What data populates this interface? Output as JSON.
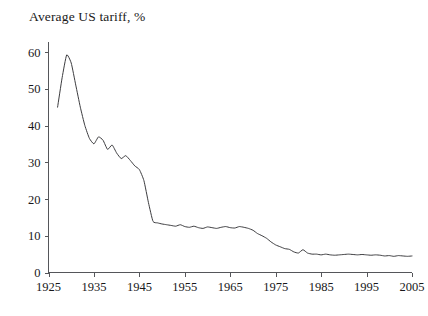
{
  "chart_data": {
    "type": "line",
    "title": "Average US tariff, %",
    "xlabel": "",
    "ylabel": "",
    "xlim": [
      1925,
      2005
    ],
    "ylim": [
      0,
      62
    ],
    "grid": false,
    "legend": null,
    "xticks": [
      "1925",
      "1935",
      "1945",
      "1955",
      "1965",
      "1975",
      "1985",
      "1995",
      "2005"
    ],
    "xtick_values": [
      1925,
      1935,
      1945,
      1955,
      1965,
      1975,
      1985,
      1995,
      2005
    ],
    "yticks": [
      "0",
      "10",
      "20",
      "30",
      "40",
      "50",
      "60"
    ],
    "ytick_values": [
      0,
      10,
      20,
      30,
      40,
      50,
      60
    ],
    "series": [
      {
        "name": "Average US tariff",
        "color": "#3c3c3f",
        "x": [
          1927,
          1928,
          1929,
          1930,
          1931,
          1932,
          1933,
          1934,
          1935,
          1936,
          1937,
          1938,
          1939,
          1940,
          1941,
          1942,
          1943,
          1944,
          1945,
          1946,
          1947,
          1948,
          1949,
          1950,
          1951,
          1952,
          1953,
          1954,
          1955,
          1956,
          1957,
          1958,
          1959,
          1960,
          1961,
          1962,
          1963,
          1964,
          1965,
          1966,
          1967,
          1968,
          1969,
          1970,
          1971,
          1972,
          1973,
          1974,
          1975,
          1976,
          1977,
          1978,
          1979,
          1980,
          1981,
          1982,
          1983,
          1984,
          1985,
          1986,
          1987,
          1988,
          1989,
          1990,
          1991,
          1992,
          1993,
          1994,
          1995,
          1996,
          1997,
          1998,
          1999,
          2000,
          2001,
          2002,
          2003,
          2004,
          2005
        ],
        "y": [
          45.0,
          53.0,
          59.2,
          57.0,
          51.0,
          45.0,
          40.0,
          36.5,
          35.0,
          36.9,
          36.0,
          33.5,
          34.7,
          32.5,
          31.0,
          31.8,
          30.5,
          29.0,
          28.0,
          25.0,
          19.0,
          13.9,
          13.5,
          13.2,
          13.0,
          12.8,
          12.6,
          13.0,
          12.5,
          12.3,
          12.6,
          12.2,
          12.0,
          12.4,
          12.2,
          12.0,
          12.3,
          12.5,
          12.2,
          12.1,
          12.5,
          12.3,
          12.0,
          11.5,
          10.6,
          10.0,
          9.3,
          8.3,
          7.5,
          7.0,
          6.5,
          6.3,
          5.6,
          5.3,
          6.2,
          5.3,
          5.0,
          5.0,
          4.8,
          5.0,
          4.8,
          4.7,
          4.8,
          4.9,
          5.0,
          4.9,
          4.8,
          4.9,
          4.8,
          4.7,
          4.8,
          4.7,
          4.5,
          4.6,
          4.4,
          4.6,
          4.5,
          4.4,
          4.5
        ]
      }
    ]
  }
}
